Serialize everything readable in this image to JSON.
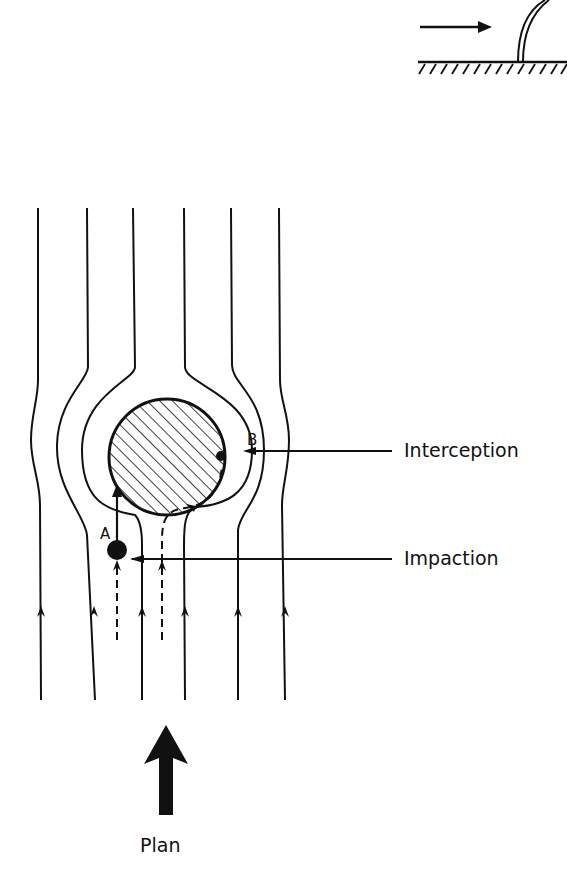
{
  "diagram": {
    "type": "particle-collection-mechanisms",
    "view": "plan",
    "labels": {
      "interception": "Interception",
      "impaction": "Impaction",
      "plan": "Plan",
      "point_a": "A",
      "point_b": "B"
    },
    "colors": {
      "ink": "#111111",
      "background": "#ffffff"
    },
    "elements": {
      "inset": "side view: flow arrow toward curved collector on hatched ground",
      "collector": "hatched circular collector",
      "streamlines": 6,
      "particle_paths": 2
    }
  }
}
